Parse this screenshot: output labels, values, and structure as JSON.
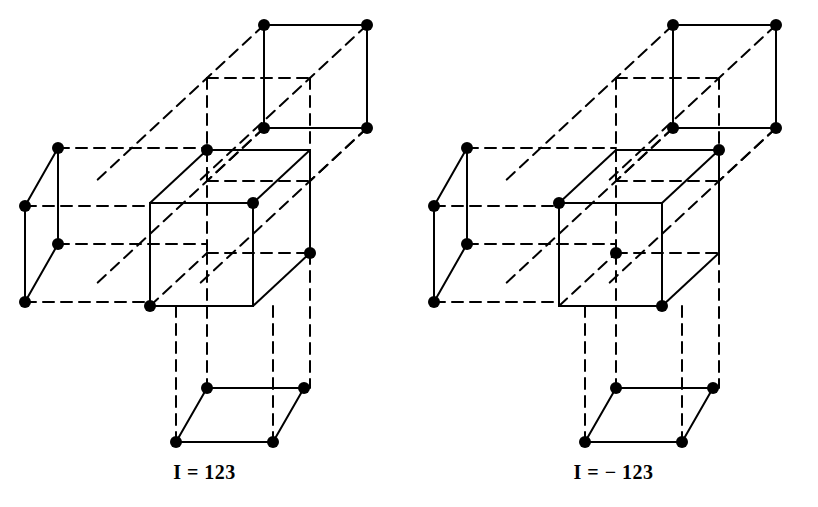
{
  "document": {
    "kind": "line-drawing",
    "background_color": "#ffffff",
    "ink_color": "#000000",
    "panel_count": 2
  },
  "style": {
    "stroke_color": "#000000",
    "solid_stroke_width": 2.0,
    "dashed_stroke_width": 2.0,
    "dash_pattern": "11 7",
    "vertex_dot_radius": 6,
    "vertex_dot_color": "#000000"
  },
  "figures": [
    {
      "id": "left-figure",
      "name": "cube-lattice-positive",
      "caption": "I = 123",
      "handedness": "right-handed",
      "cubes": [
        {
          "name": "top-cube",
          "origin": [
            264,
            25
          ],
          "edge_x": 103,
          "edge_y": 103,
          "skew_dx": -57,
          "skew_dy": 53,
          "vertices_with_dots": [
            "front-top-left",
            "front-top-right",
            "front-bottom-left",
            "front-bottom-right"
          ]
        },
        {
          "name": "center-cube",
          "origin": [
            207,
            150
          ],
          "edge_x": 103,
          "edge_y": 103,
          "skew_dx": -57,
          "skew_dy": 53,
          "vertices_with_dots": [
            "back-top-left",
            "front-top-right",
            "back-bottom-right",
            "front-bottom-left"
          ]
        },
        {
          "name": "left-cube",
          "origin": [
            58,
            148
          ],
          "edge_x": 103,
          "edge_y": 103,
          "skew_dx": -33,
          "skew_dy": 58,
          "vertices_with_dots": [
            "back-top-left",
            "front-top-left",
            "back-bottom-left",
            "front-bottom-left"
          ]
        },
        {
          "name": "bottom-cube",
          "origin": [
            207,
            388
          ],
          "edge_x": 97,
          "edge_y": 97,
          "skew_dx": -31,
          "skew_dy": 54,
          "vertices_with_dots": [
            "back-top-left",
            "back-top-right",
            "front-bottom-left",
            "front-bottom-right"
          ]
        }
      ],
      "dot_count": 16
    },
    {
      "id": "right-figure",
      "name": "cube-lattice-negative",
      "caption": "I = − 123",
      "handedness": "left-handed",
      "cubes": [
        {
          "name": "top-cube",
          "origin": [
            673,
            25
          ],
          "edge_x": 103,
          "edge_y": 103,
          "skew_dx": -57,
          "skew_dy": 53,
          "vertices_with_dots": [
            "front-top-left",
            "front-top-right",
            "front-bottom-left",
            "front-bottom-right"
          ]
        },
        {
          "name": "center-cube",
          "origin": [
            616,
            150
          ],
          "edge_x": 103,
          "edge_y": 103,
          "skew_dx": -57,
          "skew_dy": 53,
          "vertices_with_dots": [
            "back-top-right",
            "front-top-left",
            "center",
            "front-bottom-right"
          ]
        },
        {
          "name": "left-cube",
          "origin": [
            467,
            148
          ],
          "edge_x": 103,
          "edge_y": 103,
          "skew_dx": -33,
          "skew_dy": 58,
          "vertices_with_dots": [
            "back-top-left",
            "front-top-left",
            "back-bottom-left",
            "front-bottom-left"
          ]
        },
        {
          "name": "bottom-cube",
          "origin": [
            616,
            388
          ],
          "edge_x": 97,
          "edge_y": 97,
          "skew_dx": -31,
          "skew_dy": 54,
          "vertices_with_dots": [
            "back-top-left",
            "back-top-right",
            "front-bottom-left",
            "front-bottom-right"
          ]
        }
      ],
      "dot_count": 16
    }
  ],
  "captions": {
    "left": "I = 123",
    "right": "I = − 123"
  }
}
